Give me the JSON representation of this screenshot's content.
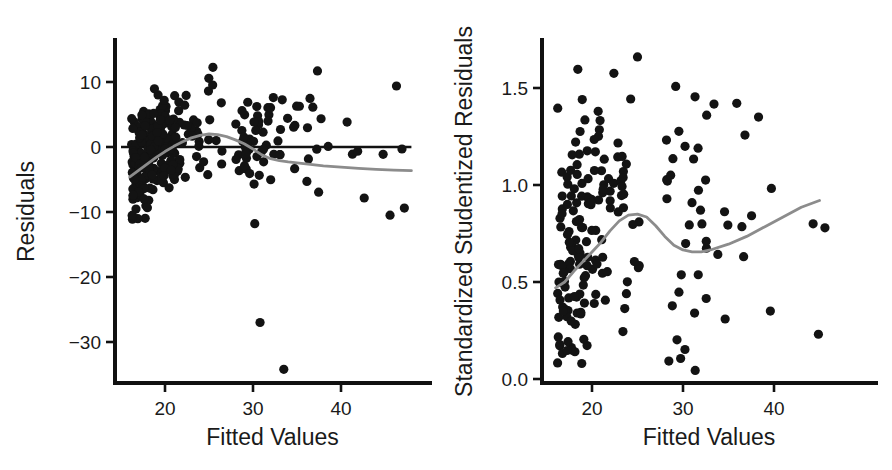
{
  "figure": {
    "width": 892,
    "height": 470,
    "background": "#ffffff",
    "point_color": "#131313",
    "axis_color": "#111111",
    "smoother_color": "#8c8c8c",
    "panel_count": 2
  },
  "chart_data": [
    {
      "type": "scatter",
      "panel": "left",
      "title": "",
      "subtitle": "",
      "xlabel": "Fitted Values",
      "ylabel": "Residuals",
      "xlim": [
        14.5,
        48.5
      ],
      "ylim": [
        -36.0,
        14.5
      ],
      "xticks": [
        20,
        30,
        40
      ],
      "xtick_labels": [
        "20",
        "30",
        "40"
      ],
      "yticks": [
        10,
        0,
        -10,
        -20,
        -30
      ],
      "ytick_labels": [
        "10",
        "0",
        "−10",
        "−20",
        "−30"
      ],
      "grid": false,
      "legend": "none",
      "annotations": [],
      "reference_line": {
        "type": "horizontal",
        "y": 0,
        "x_from": 15.0,
        "x_to": 48.0,
        "color": "#111111"
      },
      "smoother": {
        "name": "loess smoother",
        "color": "#8c8c8c",
        "x": [
          16.0,
          17.0,
          18.0,
          19.0,
          20.0,
          21.0,
          22.0,
          23.0,
          24.0,
          25.0,
          26.0,
          27.0,
          28.0,
          29.0,
          30.0,
          31.0,
          32.0,
          33.0,
          34.0,
          36.0,
          38.0,
          40.0,
          42.0,
          44.0,
          46.0,
          48.0
        ],
        "y": [
          -4.6,
          -3.6,
          -2.6,
          -1.6,
          -0.7,
          0.1,
          0.8,
          1.4,
          1.8,
          2.0,
          1.9,
          1.6,
          1.1,
          0.5,
          -0.3,
          -1.2,
          -1.8,
          -2.1,
          -2.3,
          -2.6,
          -2.9,
          -3.1,
          -3.3,
          -3.45,
          -3.55,
          -3.65
        ]
      },
      "n_points": 330,
      "point_radius_px": 4.6,
      "cloud": {
        "description": "dense residual cloud, funnel narrowing with increasing fitted value",
        "x_range": [
          15.8,
          47.5
        ],
        "core_y_range": [
          -10,
          13
        ],
        "core_density_x": [
          17,
          29
        ]
      },
      "outliers": [
        {
          "x": 30.8,
          "y": -27.0
        },
        {
          "x": 33.5,
          "y": -34.2
        },
        {
          "x": 30.2,
          "y": -11.8
        },
        {
          "x": 16.3,
          "y": -11.1
        },
        {
          "x": 47.2,
          "y": -9.4
        }
      ]
    },
    {
      "type": "scatter",
      "panel": "right",
      "title": "",
      "subtitle": "",
      "xlabel": "Fitted Values",
      "ylabel": "Standardized Studentized Residuals",
      "xlim": [
        14.5,
        48.5
      ],
      "ylim": [
        -0.06,
        1.72
      ],
      "xticks": [
        20,
        30,
        40
      ],
      "xtick_labels": [
        "20",
        "30",
        "40"
      ],
      "yticks": [
        1.5,
        1.0,
        0.5,
        0.0
      ],
      "ytick_labels": [
        "1.5",
        "1.0",
        "0.5",
        "0.0"
      ],
      "grid": false,
      "legend": "none",
      "annotations": [],
      "reference_line": null,
      "smoother": {
        "name": "loess smoother",
        "color": "#8c8c8c",
        "x": [
          16.0,
          17.0,
          18.0,
          19.0,
          20.0,
          21.0,
          22.0,
          23.0,
          24.0,
          25.0,
          26.0,
          27.0,
          28.0,
          29.0,
          30.0,
          31.0,
          32.0,
          33.0,
          35.0,
          37.0,
          39.0,
          41.0,
          43.0,
          45.0
        ],
        "y": [
          0.47,
          0.5,
          0.555,
          0.605,
          0.655,
          0.705,
          0.765,
          0.815,
          0.845,
          0.85,
          0.835,
          0.79,
          0.735,
          0.69,
          0.665,
          0.655,
          0.655,
          0.665,
          0.695,
          0.735,
          0.785,
          0.835,
          0.885,
          0.92
        ]
      },
      "n_points": 205,
      "point_radius_px": 4.6,
      "cloud": {
        "description": "scattered absolute standardized residuals, most mass between 0.0 and 1.5",
        "x_range": [
          16.0,
          44.5
        ],
        "core_y_range": [
          0.05,
          1.65
        ],
        "core_density_x": [
          18,
          29
        ]
      },
      "outliers": [
        {
          "x": 25.0,
          "y": 1.66
        },
        {
          "x": 44.3,
          "y": 0.8
        },
        {
          "x": 39.6,
          "y": 0.35
        },
        {
          "x": 38.3,
          "y": 1.35
        },
        {
          "x": 32.6,
          "y": 1.36
        }
      ]
    }
  ]
}
